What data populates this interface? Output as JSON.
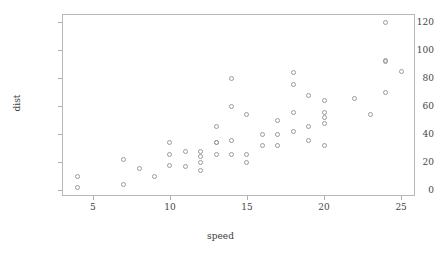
{
  "chart_data": {
    "type": "scatter",
    "title": "",
    "xlabel": "speed",
    "ylabel": "dist",
    "xlim": [
      3.0,
      25.9
    ],
    "ylim": [
      -4.0,
      126.0
    ],
    "grid": false,
    "legend": "none",
    "xticks": [
      5,
      10,
      15,
      20,
      25
    ],
    "xtick_labels": [
      "5",
      "10",
      "15",
      "20",
      "25"
    ],
    "yticks": [
      0,
      20,
      40,
      60,
      80,
      100,
      120
    ],
    "ytick_labels": [
      "0",
      "20",
      "40",
      "60",
      "80",
      "100",
      "120"
    ],
    "marker": "open-circle",
    "marker_color": "#9a9a9a",
    "frame_color": "#b8b8b8",
    "x": [
      4,
      4,
      7,
      7,
      8,
      9,
      10,
      10,
      10,
      11,
      11,
      12,
      12,
      12,
      12,
      13,
      13,
      13,
      13,
      14,
      14,
      14,
      14,
      15,
      15,
      15,
      16,
      16,
      17,
      17,
      17,
      18,
      18,
      18,
      18,
      19,
      19,
      19,
      20,
      20,
      20,
      20,
      20,
      22,
      23,
      24,
      24,
      24,
      24,
      25
    ],
    "y": [
      2,
      10,
      4,
      22,
      16,
      10,
      18,
      26,
      34,
      17,
      28,
      14,
      20,
      24,
      28,
      26,
      34,
      34,
      46,
      26,
      36,
      60,
      80,
      20,
      26,
      54,
      32,
      40,
      32,
      40,
      50,
      42,
      56,
      76,
      84,
      36,
      46,
      68,
      32,
      48,
      52,
      56,
      64,
      66,
      54,
      70,
      92,
      93,
      120,
      85
    ]
  },
  "axes": {
    "x_title": "speed",
    "y_title": "dist"
  }
}
